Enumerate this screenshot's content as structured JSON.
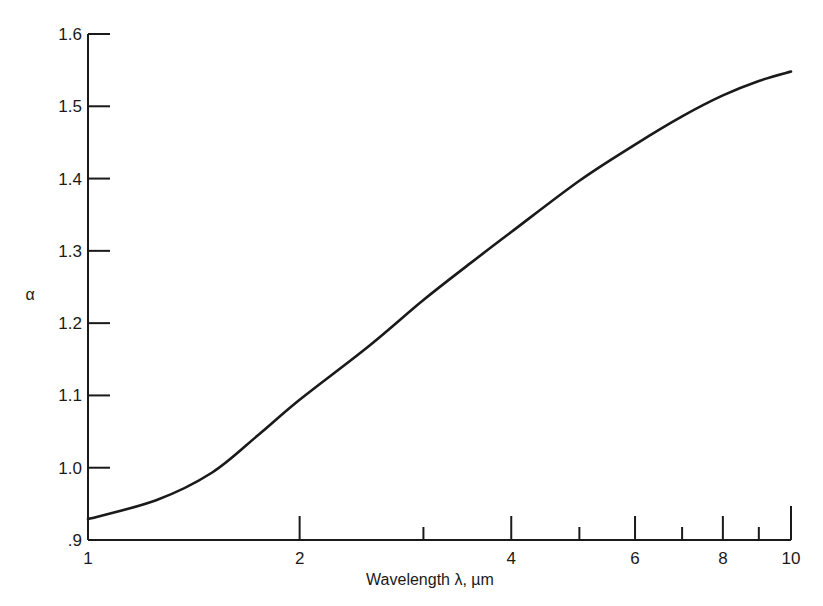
{
  "chart_data": {
    "type": "line",
    "title": "",
    "xlabel": "Wavelength  λ,  µm",
    "ylabel": "α",
    "xscale": "log",
    "xlim": [
      1,
      10
    ],
    "ylim": [
      0.9,
      1.6
    ],
    "grid": false,
    "legend": null,
    "x_ticks": [
      1,
      2,
      3,
      4,
      5,
      6,
      7,
      8,
      9,
      10
    ],
    "x_tick_labels": [
      {
        "value": 1,
        "label": "1"
      },
      {
        "value": 2,
        "label": "2"
      },
      {
        "value": 4,
        "label": "4"
      },
      {
        "value": 6,
        "label": "6"
      },
      {
        "value": 8,
        "label": "8"
      },
      {
        "value": 10,
        "label": "10"
      }
    ],
    "y_ticks": [
      0.9,
      1.0,
      1.1,
      1.2,
      1.3,
      1.4,
      1.5,
      1.6
    ],
    "y_tick_labels": [
      ".9",
      "1.0",
      "1.1",
      "1.2",
      "1.3",
      "1.4",
      "1.5",
      "1.6"
    ],
    "series": [
      {
        "name": "alpha",
        "color": "#1a1a1a",
        "x": [
          1.0,
          1.25,
          1.5,
          1.75,
          2.0,
          2.5,
          3.0,
          3.5,
          4.0,
          5.0,
          6.0,
          7.0,
          8.0,
          9.0,
          10.0
        ],
        "y": [
          0.929,
          0.955,
          0.993,
          1.046,
          1.094,
          1.167,
          1.232,
          1.283,
          1.326,
          1.397,
          1.447,
          1.486,
          1.515,
          1.535,
          1.548
        ]
      }
    ]
  },
  "labels": {
    "ylabel": "α",
    "xlabel": "Wavelength  λ,  µm"
  }
}
